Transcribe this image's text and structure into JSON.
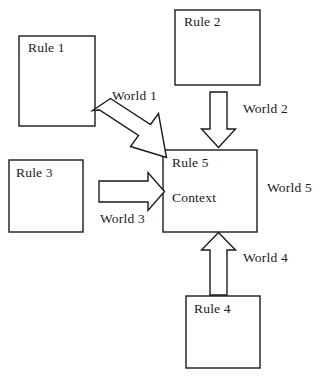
{
  "diagram": {
    "background_color": "#ffffff",
    "stroke_color": "#1a1a1a",
    "nodes": [
      {
        "id": "rule1",
        "label": "Rule 1",
        "shape": "rectangle",
        "x": 19,
        "y": 36,
        "w": 76,
        "h": 90
      },
      {
        "id": "rule2",
        "label": "Rule 2",
        "shape": "rectangle",
        "x": 175,
        "y": 10,
        "w": 85,
        "h": 75
      },
      {
        "id": "rule3",
        "label": "Rule 3",
        "shape": "rectangle",
        "x": 9,
        "y": 160,
        "w": 74,
        "h": 72
      },
      {
        "id": "rule4",
        "label": "Rule 4",
        "shape": "rectangle",
        "x": 186,
        "y": 296,
        "w": 74,
        "h": 72
      },
      {
        "id": "rule5",
        "label": "Rule 5",
        "sublabel": "Context",
        "shape": "rectangle",
        "x": 163,
        "y": 150,
        "w": 94,
        "h": 82
      }
    ],
    "edges": [
      {
        "id": "world1",
        "label": "World 1",
        "from": "rule1",
        "to": "rule5",
        "direction": "diagonal-down-right",
        "label_x": 112,
        "label_y": 88
      },
      {
        "id": "world2",
        "label": "World 2",
        "from": "rule2",
        "to": "rule5",
        "direction": "down",
        "label_x": 243,
        "label_y": 101
      },
      {
        "id": "world3",
        "label": "World 3",
        "from": "rule3",
        "to": "rule5",
        "direction": "right",
        "label_x": 100,
        "label_y": 211
      },
      {
        "id": "world4",
        "label": "World 4",
        "from": "rule4",
        "to": "rule5",
        "direction": "up",
        "label_x": 243,
        "label_y": 250
      }
    ],
    "annotations": [
      {
        "id": "world5",
        "label": "World 5",
        "x": 267,
        "y": 180
      }
    ]
  }
}
